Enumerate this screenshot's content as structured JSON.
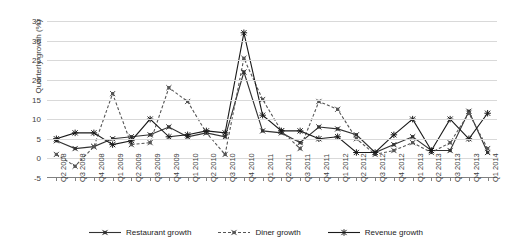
{
  "chart_data": {
    "type": "line",
    "title": "",
    "xlabel": "",
    "ylabel": "Quarterly growth  (%)",
    "ylim": [
      -5,
      35
    ],
    "ytick_values": [
      35,
      30,
      25,
      20,
      15,
      10,
      5,
      0,
      -5
    ],
    "ytick_labels": [
      "35",
      "30",
      "25",
      "20",
      "15",
      "10",
      "5",
      "0",
      "-5"
    ],
    "grid": true,
    "legend_position": "bottom",
    "categories": [
      "Q2 2008",
      "Q3 2008",
      "Q4 2008",
      "Q1 2009",
      "Q2 2009",
      "Q3 2009",
      "Q4 2009",
      "Q1 2010",
      "Q2 2010",
      "Q3 2010",
      "Q4 2010",
      "Q1 2011",
      "Q2 2011",
      "Q3 2011",
      "Q4 2011",
      "Q1 2012",
      "Q2 2012",
      "Q3 2012",
      "Q4 2012",
      "Q1 2013",
      "Q2 2013",
      "Q3 2013",
      "Q4 2013",
      "Q1 2014"
    ],
    "series": [
      {
        "name": "Restaurant growth",
        "style": "solid",
        "color": "#333333",
        "marker": "x-square",
        "values": [
          4.5,
          2.5,
          3.0,
          5.0,
          5.5,
          6.0,
          8.0,
          5.5,
          6.5,
          5.5,
          22.0,
          7.0,
          6.5,
          4.0,
          8.0,
          7.5,
          6.0,
          1.5,
          3.5,
          5.5,
          2.0,
          2.0,
          12.0,
          1.5
        ]
      },
      {
        "name": "Diner growth",
        "style": "dashed",
        "color": "#555555",
        "marker": "x-square",
        "values": [
          1.0,
          -2.0,
          3.0,
          16.5,
          3.5,
          4.0,
          18.0,
          14.5,
          6.5,
          1.0,
          25.5,
          15.0,
          7.0,
          2.5,
          14.5,
          12.5,
          5.0,
          1.0,
          2.0,
          4.0,
          1.5,
          4.0,
          11.5,
          2.5
        ]
      },
      {
        "name": "Revenue growth",
        "style": "solid",
        "color": "#1a1a1a",
        "marker": "star",
        "values": [
          5.0,
          6.5,
          6.5,
          3.5,
          4.5,
          10.0,
          5.5,
          6.0,
          7.0,
          6.5,
          32.0,
          11.0,
          7.0,
          7.0,
          5.0,
          5.5,
          1.5,
          1.5,
          6.0,
          10.0,
          2.0,
          10.0,
          5.0,
          11.5
        ]
      }
    ]
  },
  "legend": {
    "items": [
      {
        "label": "Restaurant growth"
      },
      {
        "label": "Diner growth"
      },
      {
        "label": "Revenue growth"
      }
    ]
  }
}
